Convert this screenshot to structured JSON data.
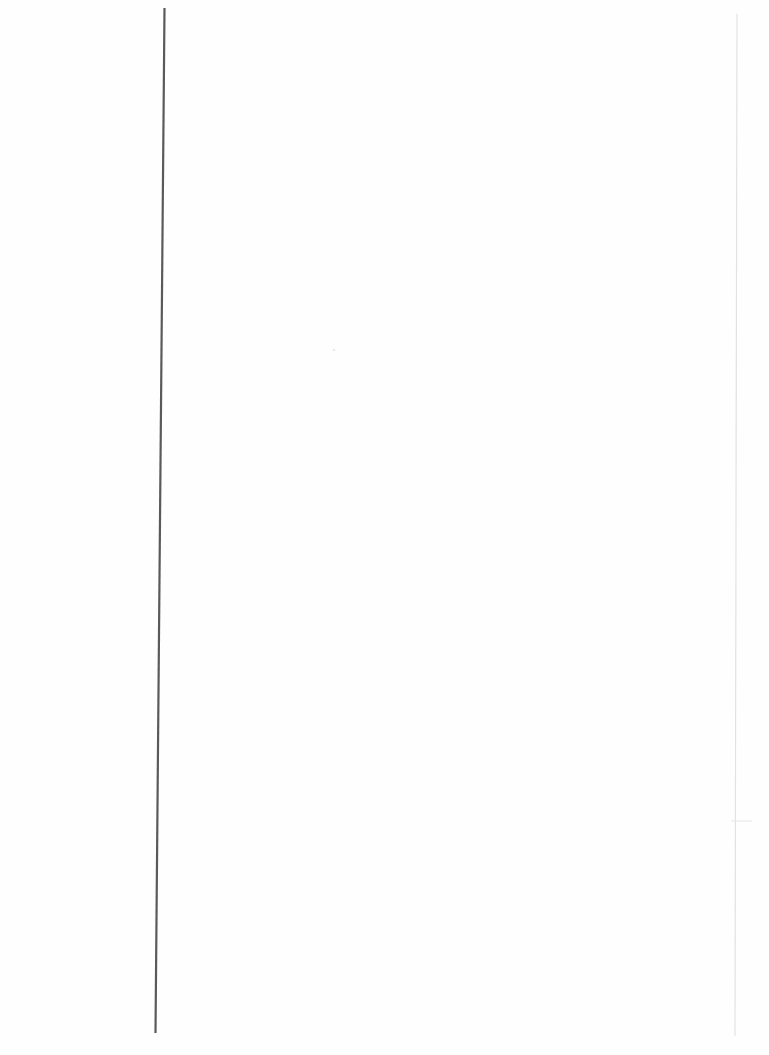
{
  "page": {
    "type": "blank scanned page",
    "text": ""
  },
  "colors": {
    "background": "#fefefe",
    "left_rule": "#5a5a5a",
    "right_rule": "#e2e2e2"
  }
}
